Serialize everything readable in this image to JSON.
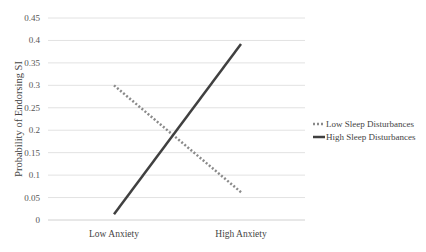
{
  "chart_data": {
    "type": "line",
    "title": "",
    "xlabel": "",
    "ylabel": "Probability of Endorsing SI",
    "categories": [
      "Low Anxiety",
      "High Anxiety"
    ],
    "series": [
      {
        "name": "Low Sleep Disturbances",
        "values": [
          0.3,
          0.062
        ],
        "style": "dotted",
        "color": "#8a8a8a"
      },
      {
        "name": "High Sleep Disturbances",
        "values": [
          0.013,
          0.392
        ],
        "style": "solid",
        "color": "#404040"
      }
    ],
    "ylim": [
      0,
      0.45
    ],
    "yticks": [
      "0",
      "0.05",
      "0.1",
      "0.15",
      "0.2",
      "0.25",
      "0.3",
      "0.35",
      "0.4",
      "0.45"
    ],
    "grid": true,
    "legend_position": "right"
  }
}
